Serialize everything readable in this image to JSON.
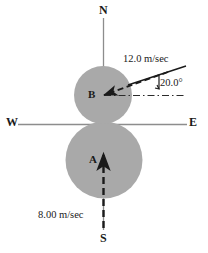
{
  "figure": {
    "type": "physics-collision-diagram",
    "background_color": "#ffffff",
    "ball_fill_color": "#a8a8a8",
    "axis_color": "#8a8a8a",
    "vector_color": "#1a1a1a"
  },
  "compass": {
    "north": "N",
    "south": "S",
    "west": "W",
    "east": "E"
  },
  "balls": [
    {
      "label": "B",
      "cx": 103,
      "cy": 95,
      "r": 29,
      "position": "upper"
    },
    {
      "label": "A",
      "cx": 104,
      "cy": 160,
      "r": 38,
      "position": "lower"
    }
  ],
  "vectors": [
    {
      "target": "B",
      "speed": "12.0 m/sec",
      "angle": "20.0°",
      "style": "dashed",
      "direction": "toward-southwest-into-B"
    },
    {
      "target": "A",
      "speed": "8.00 m/sec",
      "style": "dashed",
      "direction": "north-into-A"
    }
  ],
  "annotations": {
    "angle_value": "20.0°",
    "speed_b": "12.0 m/sec",
    "speed_a": "8.00 m/sec"
  }
}
